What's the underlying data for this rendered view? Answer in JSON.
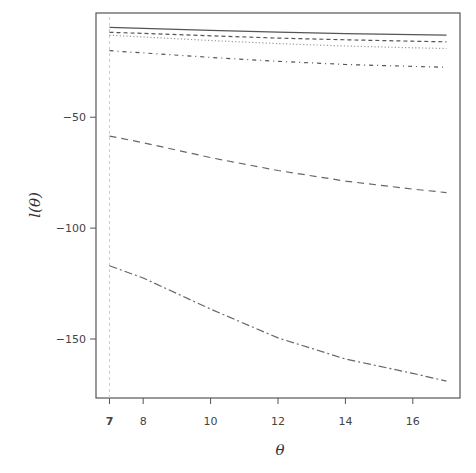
{
  "chart_data": {
    "type": "line",
    "title": "",
    "xlabel": "θ",
    "ylabel": "l(θ)",
    "xlim": [
      6.6,
      17.4
    ],
    "ylim": [
      -176.6,
      -3
    ],
    "grid": false,
    "legend": null,
    "x_ticks": [
      7,
      8,
      10,
      12,
      14,
      16
    ],
    "x_tick_labels": [
      "7",
      "8",
      "10",
      "12",
      "14",
      "16"
    ],
    "y_ticks": [
      -50,
      -100,
      -150
    ],
    "y_tick_labels": [
      "−50",
      "−100",
      "−150"
    ],
    "annotations": [
      {
        "type": "vertical-line",
        "x": 7,
        "style": "dashed",
        "color": "#cccccc"
      }
    ],
    "x": [
      7,
      8,
      10,
      12,
      14,
      16,
      17
    ],
    "series": [
      {
        "name": "solid",
        "style": "solid",
        "color": "#555555",
        "values": [
          -9.5,
          -9.9,
          -10.8,
          -11.6,
          -12.3,
          -12.8,
          -13.0
        ]
      },
      {
        "name": "short-dashed",
        "style": "short-dash",
        "color": "#555555",
        "values": [
          -11.7,
          -12.2,
          -13.3,
          -14.3,
          -15.1,
          -15.7,
          -16.0
        ]
      },
      {
        "name": "dotted",
        "style": "dotted",
        "color": "#999999",
        "values": [
          -13.0,
          -13.8,
          -15.4,
          -16.8,
          -17.9,
          -18.7,
          -19.0
        ]
      },
      {
        "name": "dot-dashed-upper",
        "style": "dot-dash",
        "color": "#555555",
        "values": [
          -20.0,
          -21.0,
          -23.0,
          -24.8,
          -26.2,
          -27.1,
          -27.5
        ]
      },
      {
        "name": "long-dashed",
        "style": "long-dash",
        "color": "#666666",
        "values": [
          -58.5,
          -61.5,
          -68.2,
          -74.0,
          -78.8,
          -82.4,
          -84.0
        ]
      },
      {
        "name": "dot-dashed-lower",
        "style": "long-dot-dash",
        "color": "#666666",
        "values": [
          -117.0,
          -122.5,
          -136.5,
          -149.5,
          -159.0,
          -165.5,
          -169.0
        ]
      }
    ]
  }
}
